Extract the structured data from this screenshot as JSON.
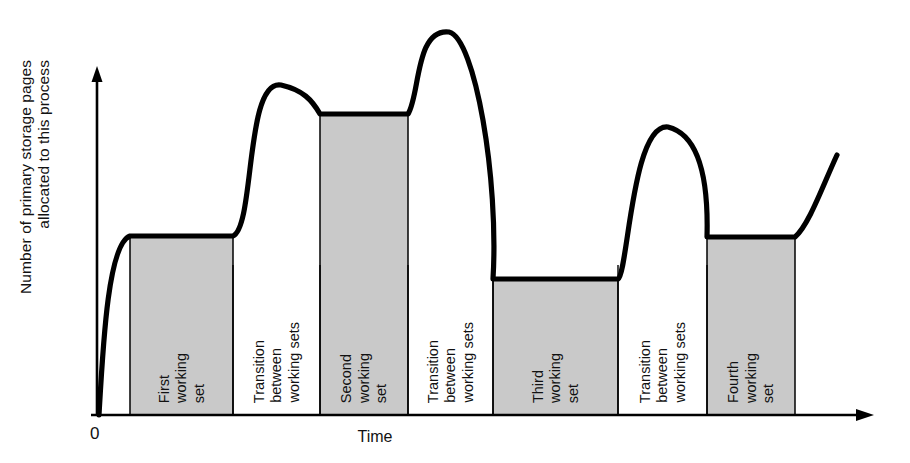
{
  "chart_data": {
    "type": "area",
    "title": "",
    "subtitle": "",
    "xlabel": "Time",
    "ylabel": "Number of primary storage pages allocated to this process",
    "ylabel_lines": [
      "Number of primary storage pages",
      "allocated to this process"
    ],
    "origin_label": "0",
    "grid": false,
    "legend": null,
    "axis_ranges": {
      "x": [
        0,
        1
      ],
      "y": [
        0,
        1
      ]
    },
    "series_name": "Pages allocated to process",
    "colors": {
      "curve": "#000000",
      "shaded_band_fill": "#c9c9c9",
      "unshaded_band_fill": "#ffffff",
      "band_border": "#000000",
      "axis": "#000000",
      "text": "#111111"
    },
    "bands": [
      {
        "id": "first-working-set",
        "label_lines": [
          "First",
          "working",
          "set"
        ],
        "shaded": true,
        "x_start": 130,
        "x_end": 233,
        "plateau_y": 236,
        "level": 0.52
      },
      {
        "id": "transition-1",
        "label_lines": [
          "Transition",
          "between",
          "working sets"
        ],
        "shaded": false,
        "x_start": 233,
        "x_end": 320,
        "peak_y": 85,
        "level": 0.95
      },
      {
        "id": "second-working-set",
        "label_lines": [
          "Second",
          "working",
          "set"
        ],
        "shaded": true,
        "x_start": 320,
        "x_end": 408,
        "plateau_y": 114,
        "level": 0.88
      },
      {
        "id": "transition-2",
        "label_lines": [
          "Transition",
          "between",
          "working sets"
        ],
        "shaded": false,
        "x_start": 408,
        "x_end": 493,
        "peak_y": 32,
        "level": 1.0
      },
      {
        "id": "third-working-set",
        "label_lines": [
          "Third",
          "working",
          "set"
        ],
        "shaded": true,
        "x_start": 493,
        "x_end": 618,
        "plateau_y": 279,
        "level": 0.4
      },
      {
        "id": "transition-3",
        "label_lines": [
          "Transition",
          "between",
          "working sets"
        ],
        "shaded": false,
        "x_start": 618,
        "x_end": 707,
        "peak_y": 127,
        "level": 0.85
      },
      {
        "id": "fourth-working-set",
        "label_lines": [
          "Fourth",
          "working",
          "set"
        ],
        "shaded": true,
        "x_start": 707,
        "x_end": 795,
        "plateau_y": 237,
        "level": 0.52
      }
    ],
    "curve_points_note": "Curve rises from origin, plateaus at each working-set level, peaks during each transition, and rises again at the right edge.",
    "curve_key_values": {
      "start": {
        "x": 99,
        "y": 415
      },
      "first_plateau": {
        "x_from": 130,
        "x_to": 233,
        "y": 236
      },
      "peak_1": {
        "x": 281,
        "y": 85
      },
      "second_plateau": {
        "x_from": 320,
        "x_to": 408,
        "y": 114
      },
      "peak_2": {
        "x": 449,
        "y": 32
      },
      "third_plateau": {
        "x_from": 493,
        "x_to": 618,
        "y": 279
      },
      "peak_3": {
        "x": 668,
        "y": 127
      },
      "fourth_plateau": {
        "x_from": 707,
        "x_to": 795,
        "y": 237
      },
      "end": {
        "x": 837,
        "y": 155
      }
    }
  }
}
